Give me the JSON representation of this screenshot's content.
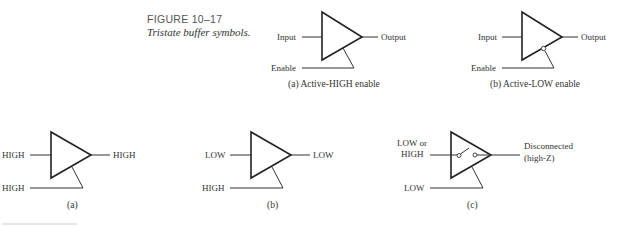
{
  "figure": {
    "number": "FIGURE 10–17",
    "title": "Tristate buffer symbols."
  },
  "top_row": [
    {
      "id": "a",
      "input_label": "Input",
      "output_label": "Output",
      "enable_label": "Enable",
      "enable_active": "HIGH",
      "caption": "(a)  Active-HIGH enable"
    },
    {
      "id": "b",
      "input_label": "Input",
      "output_label": "Output",
      "enable_label": "Enable",
      "enable_active": "LOW",
      "caption": "(b) Active-LOW enable"
    }
  ],
  "bottom_row": [
    {
      "id": "a",
      "input": "HIGH",
      "output": "HIGH",
      "enable": "HIGH",
      "caption": "(a)"
    },
    {
      "id": "b",
      "input": "LOW",
      "output": "LOW",
      "enable": "HIGH",
      "caption": "(b)"
    },
    {
      "id": "c",
      "input_line1": "LOW or",
      "input_line2": "HIGH",
      "output_line1": "Disconnected",
      "output_line2": "(high-Z)",
      "enable": "LOW",
      "caption": "(c)"
    }
  ]
}
